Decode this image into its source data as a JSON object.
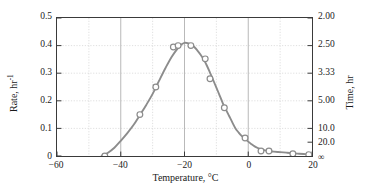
{
  "chart_data": {
    "type": "line",
    "title": "",
    "xlabel": "Temperature, °C",
    "ylabel": "Rate, hr",
    "ylabel_sup": "-1",
    "y2label": "Time, hr",
    "xlim": [
      -60,
      20
    ],
    "ylim": [
      0,
      0.5
    ],
    "grid": true,
    "legend": "none",
    "xticks": [
      -60,
      -40,
      -20,
      0,
      20
    ],
    "xticklabels": [
      "−60",
      "−40",
      "−20",
      "0",
      "20"
    ],
    "xminorticks": [
      -50,
      -30,
      -10,
      10
    ],
    "yticks": [
      0,
      0.1,
      0.2,
      0.3,
      0.4,
      0.5
    ],
    "yticklabels": [
      "0",
      "0.1",
      "0.2",
      "0.3",
      "0.4",
      "0.5"
    ],
    "y2ticks": [
      0.5,
      0.4,
      0.3,
      0.2,
      0.1,
      0.05,
      0
    ],
    "y2ticklabels": [
      "2.00",
      "2.50",
      "3.33",
      "5.00",
      "10.0",
      "20.0",
      "∞"
    ],
    "series": [
      {
        "name": "Crystallization rate",
        "marker": "open-circle",
        "color": "#8c8c8c",
        "x": [
          -45,
          -34,
          -29,
          -23.5,
          -22,
          -18,
          -13.5,
          -12,
          -7.5,
          -1,
          4,
          6.5,
          14,
          19
        ],
        "y": [
          0.0,
          0.15,
          0.25,
          0.395,
          0.4,
          0.4,
          0.352,
          0.28,
          0.175,
          0.065,
          0.018,
          0.018,
          0.008,
          0.005
        ]
      }
    ],
    "curve": {
      "color": "#8c8c8c",
      "x": [
        -46,
        -44,
        -42,
        -40,
        -38,
        -36,
        -34,
        -32,
        -30,
        -28,
        -26,
        -24,
        -22,
        -21,
        -20,
        -19,
        -18,
        -17,
        -16,
        -15,
        -14,
        -13,
        -12,
        -11,
        -10,
        -9,
        -8,
        -7,
        -6,
        -5,
        -4,
        -3,
        -2,
        -1,
        0,
        1,
        2,
        3,
        4,
        5,
        6,
        7,
        8,
        10,
        12,
        14,
        16,
        18,
        20
      ],
      "y": [
        0.0,
        0.012,
        0.03,
        0.055,
        0.082,
        0.112,
        0.148,
        0.185,
        0.225,
        0.272,
        0.318,
        0.36,
        0.392,
        0.404,
        0.41,
        0.409,
        0.404,
        0.396,
        0.383,
        0.368,
        0.35,
        0.328,
        0.302,
        0.275,
        0.248,
        0.22,
        0.192,
        0.168,
        0.145,
        0.122,
        0.1,
        0.085,
        0.072,
        0.062,
        0.052,
        0.043,
        0.035,
        0.029,
        0.024,
        0.021,
        0.019,
        0.017,
        0.016,
        0.014,
        0.012,
        0.01,
        0.008,
        0.007,
        0.006
      ]
    }
  }
}
